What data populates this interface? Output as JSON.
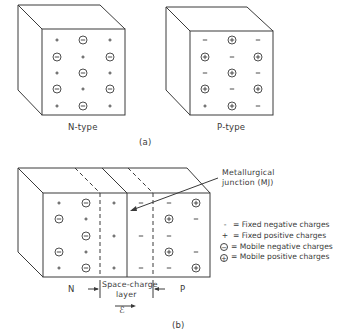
{
  "figure": {
    "part_a": {
      "caption": "(a)",
      "n_type": {
        "label": "N-type",
        "grid": [
          [
            "+",
            "(-)",
            "+"
          ],
          [
            "(-)",
            "+",
            "(-)"
          ],
          [
            "+",
            "(-)",
            "+"
          ],
          [
            "(-)",
            "+",
            "(-)"
          ],
          [
            "+",
            "(-)",
            "+"
          ]
        ]
      },
      "p_type": {
        "label": "P-type",
        "grid": [
          [
            "-",
            "(+)",
            "-"
          ],
          [
            "(+)",
            "-",
            "(+)"
          ],
          [
            "-",
            "(+)",
            "-"
          ],
          [
            "(+)",
            "-",
            "(+)"
          ],
          [
            "+",
            "(+)",
            "-"
          ]
        ]
      }
    },
    "part_b": {
      "caption": "(b)",
      "junction_label_line1": "Metallurgical",
      "junction_label_line2": "junction (MJ)",
      "n_label": "N",
      "p_label": "P",
      "space_charge_line1": "Space-charge",
      "space_charge_line2": "layer",
      "field_symbol": "ℰ",
      "columns": [
        [
          "+",
          "(-)",
          "",
          "(-)",
          "+"
        ],
        [
          "(-)",
          "+",
          "(-)",
          "+",
          "(-)"
        ],
        [
          "+",
          "",
          "+",
          "",
          "+"
        ],
        [
          "-",
          "",
          "-",
          "",
          "-"
        ],
        [
          "-",
          "(+)",
          "-",
          "(+)",
          "-"
        ],
        [
          "(+)",
          "-",
          "",
          "-",
          "(+)"
        ]
      ]
    },
    "legend": [
      {
        "symbol": "-",
        "symbol_type": "fixed",
        "text": "= Fixed negative charges"
      },
      {
        "symbol": "+",
        "symbol_type": "fixed",
        "text": "= Fixed positive charges"
      },
      {
        "symbol": "−",
        "symbol_type": "circled",
        "text": "= Mobile negative charges"
      },
      {
        "symbol": "+",
        "symbol_type": "circled",
        "text": "= Mobile positive charges"
      }
    ]
  }
}
